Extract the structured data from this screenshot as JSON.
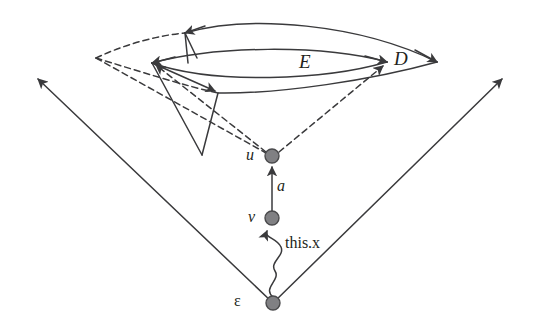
{
  "figure": {
    "type": "diagram",
    "title": "",
    "width": 535,
    "height": 328,
    "background_color": "#ffffff",
    "stroke_color": "#3a3a3c",
    "node_fill_color": "#808083",
    "node_stroke_color": "#4a4a4c",
    "text_color": "#231f20"
  },
  "labels": {
    "set_e": "E",
    "set_d": "D",
    "node_u": "u",
    "node_v": "v",
    "node_epsilon": "ε",
    "edge_a": "a",
    "edge_thisx": "this.x"
  },
  "nodes": [
    {
      "id": "u",
      "label": "u",
      "x": 272,
      "y": 156,
      "radius": 7,
      "style": "filled-gray"
    },
    {
      "id": "v",
      "label": "v",
      "x": 272,
      "y": 218,
      "radius": 7,
      "style": "filled-gray"
    },
    {
      "id": "epsilon",
      "label": "ε",
      "x": 273,
      "y": 303,
      "radius": 7,
      "style": "filled-gray"
    }
  ],
  "label_positions": [
    {
      "name": "set-e-label",
      "text": "E",
      "x": 299,
      "y": 52,
      "style": "italic",
      "size": 19
    },
    {
      "name": "set-d-label",
      "text": "D",
      "x": 394,
      "y": 49,
      "style": "italic",
      "size": 19
    },
    {
      "name": "node-u-label",
      "text": "u",
      "x": 246,
      "y": 147,
      "style": "italic",
      "size": 16
    },
    {
      "name": "node-v-label",
      "text": "v",
      "x": 248,
      "y": 209,
      "style": "italic",
      "size": 16
    },
    {
      "name": "edge-a-label",
      "text": "a",
      "x": 277,
      "y": 178,
      "style": "italic",
      "size": 16
    },
    {
      "name": "edge-thisx-label",
      "text": "this.x",
      "x": 285,
      "y": 235,
      "style": "upright",
      "size": 16
    },
    {
      "name": "node-epsilon-label",
      "text": "ε",
      "x": 234,
      "y": 293,
      "style": "upright",
      "size": 16
    }
  ],
  "edges": [
    {
      "name": "cone-ray-left",
      "from": "epsilon",
      "to_point": [
        35,
        76
      ],
      "style": "solid",
      "arrow": "end"
    },
    {
      "name": "cone-ray-right",
      "from": "epsilon",
      "to_point": [
        505,
        76
      ],
      "style": "solid",
      "arrow": "end"
    },
    {
      "name": "edge-a",
      "from": "v",
      "to": "u",
      "style": "solid",
      "arrow": "end"
    },
    {
      "name": "edge-this-x",
      "from": "epsilon",
      "to": "v",
      "style": "wavy",
      "arrow": "end"
    },
    {
      "name": "dashed-u-to-left-vertex",
      "from": "u",
      "to_point": [
        152,
        63
      ],
      "style": "dashed",
      "arrow": "end"
    },
    {
      "name": "dashed-u-to-right-vertex",
      "from": "u",
      "to_point": [
        387,
        62
      ],
      "style": "dashed",
      "arrow": "end"
    },
    {
      "name": "dashed-apex-to-d-start",
      "from_point": [
        96,
        58
      ],
      "to_point": [
        185,
        33
      ],
      "style": "dashed",
      "arrow": "none"
    },
    {
      "name": "dashed-apex-to-inner",
      "from_point": [
        96,
        58
      ],
      "to_point": [
        218,
        93
      ],
      "style": "dashed",
      "arrow": "none"
    },
    {
      "name": "dashed-apex-to-u-line",
      "from_point": [
        96,
        58
      ],
      "to_point": [
        272,
        156
      ],
      "style": "dashed",
      "arrow": "none"
    },
    {
      "name": "solid-left-vertex-down",
      "from_point": [
        152,
        63
      ],
      "to_point": [
        202,
        155
      ],
      "style": "solid",
      "arrow": "none"
    },
    {
      "name": "solid-left-vertex-to-inner",
      "from_point": [
        152,
        63
      ],
      "to_point": [
        218,
        93
      ],
      "style": "solid",
      "arrow": "end"
    },
    {
      "name": "solid-inner-down",
      "from_point": [
        218,
        93
      ],
      "to_point": [
        202,
        155
      ],
      "style": "solid",
      "arrow": "none"
    },
    {
      "name": "solid-sliver-left",
      "from_point": [
        185,
        33
      ],
      "to_point": [
        188,
        63
      ],
      "style": "solid",
      "arrow": "none"
    },
    {
      "name": "solid-sliver-right",
      "from_point": [
        185,
        33
      ],
      "to_point": [
        197,
        58
      ],
      "style": "solid",
      "arrow": "none"
    }
  ],
  "regions": [
    {
      "name": "lens-e",
      "label": "E",
      "left_vertex": [
        152,
        63
      ],
      "right_vertex": [
        387,
        62
      ],
      "top_bulge_y": 47,
      "bottom_bulge_y": 81
    },
    {
      "name": "lens-d",
      "label": "D",
      "left_vertex": [
        185,
        33
      ],
      "right_vertex": [
        437,
        62
      ],
      "upper_arc_peak_y": 20,
      "lower_arc_left_vertex": [
        218,
        93
      ]
    }
  ]
}
